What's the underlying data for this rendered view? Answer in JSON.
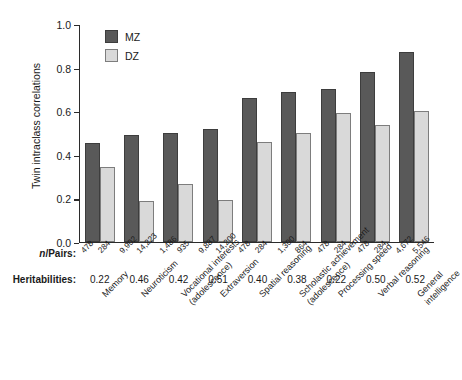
{
  "chart_data": {
    "type": "bar",
    "title": "",
    "xlabel": "",
    "ylabel": "Twin intraclass correlations",
    "ylim": [
      0.0,
      1.0
    ],
    "ytick_labels": [
      "1.0",
      "0.8",
      "0.6",
      "0.4",
      "0.2",
      "0.0"
    ],
    "ytick_values": [
      1.0,
      0.8,
      0.6,
      0.4,
      0.2,
      0.0
    ],
    "grid": false,
    "legend_position": "top-left-inside",
    "categories": [
      "Memory",
      "Neuroticism",
      "Vocational interests\n(adolescence)",
      "Extraversion",
      "Spatial reasoning",
      "Scholastic achievement\n(adolescence)",
      "Processing speed",
      "Verbal reasoning",
      "General\nintelligence"
    ],
    "category_lines": [
      [
        "Memory"
      ],
      [
        "Neuroticism"
      ],
      [
        "Vocational interests",
        "(adolescence)"
      ],
      [
        "Extraversion"
      ],
      [
        "Spatial reasoning"
      ],
      [
        "Scholastic achievement",
        "(adolescence)"
      ],
      [
        "Processing speed"
      ],
      [
        "Verbal reasoning"
      ],
      [
        "General",
        "intelligence"
      ]
    ],
    "series": [
      {
        "name": "MZ",
        "color": "#595959",
        "values": [
          0.455,
          0.49,
          0.5,
          0.52,
          0.66,
          0.69,
          0.7,
          0.78,
          0.87
        ]
      },
      {
        "name": "DZ",
        "color": "#d9d9d9",
        "values": [
          0.345,
          0.19,
          0.265,
          0.195,
          0.46,
          0.5,
          0.59,
          0.535,
          0.6
        ]
      }
    ],
    "annotation_rows": [
      {
        "key": "npairs",
        "label_prefix": "n",
        "label_suffix": "/Pairs:",
        "values": [
          [
            "478",
            "284"
          ],
          [
            "9,902",
            "14,223"
          ],
          [
            "1,486",
            "935"
          ],
          [
            "9,887",
            "14,200"
          ],
          [
            "478",
            "284"
          ],
          [
            "1,300",
            "864"
          ],
          [
            "478",
            "284"
          ],
          [
            "478",
            "284"
          ],
          [
            "4,672",
            "5,546"
          ]
        ]
      },
      {
        "key": "heritabilities",
        "label": "Heritabilities:",
        "values": [
          "0.22",
          "0.46",
          "0.42",
          "0.51",
          "0.40",
          "0.38",
          "0.22",
          "0.50",
          "0.52"
        ]
      }
    ]
  }
}
